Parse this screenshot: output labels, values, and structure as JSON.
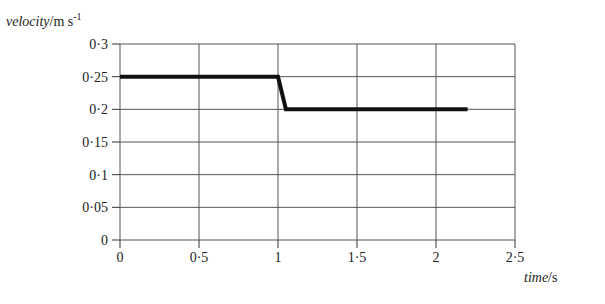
{
  "chart_data": {
    "type": "line",
    "title": "",
    "xlabel": "time/s",
    "ylabel": "velocity/m s-1",
    "ylabel_parts": {
      "italic": "velocity",
      "unit": "/m s",
      "sup": "-1"
    },
    "xlabel_parts": {
      "italic": "time",
      "unit": "/s"
    },
    "xlim": [
      0,
      2.5
    ],
    "ylim": [
      0,
      0.3
    ],
    "x_ticks": [
      0,
      0.5,
      1,
      1.5,
      2,
      2.5
    ],
    "x_tick_labels": [
      "0",
      "0·5",
      "1",
      "1·5",
      "2",
      "2·5"
    ],
    "y_ticks": [
      0,
      0.05,
      0.1,
      0.15,
      0.2,
      0.25,
      0.3
    ],
    "y_tick_labels": [
      "0",
      "0·05",
      "0·1",
      "0·15",
      "0·2",
      "0·25",
      "0·3"
    ],
    "grid": true,
    "legend": null,
    "series": [
      {
        "name": "velocity",
        "color": "#111111",
        "x": [
          0,
          1.0,
          1.05,
          2.2
        ],
        "y": [
          0.25,
          0.25,
          0.2,
          0.2
        ]
      }
    ]
  },
  "layout": {
    "plot_left": 120,
    "plot_right": 515,
    "plot_top": 44,
    "plot_bottom": 240,
    "grid_color": "#555555",
    "axis_color": "#333333"
  }
}
